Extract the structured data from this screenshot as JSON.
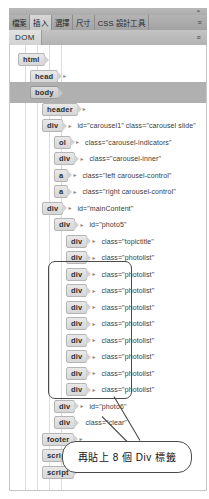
{
  "window": {
    "toolbar_tabs": [
      {
        "label": "檔案",
        "active": false
      },
      {
        "label": "插入",
        "active": true
      },
      {
        "label": "選擇",
        "active": false
      },
      {
        "label": "尺寸",
        "active": false
      },
      {
        "label": "CSS 設計工具",
        "active": false
      }
    ],
    "toolbar_menu_icon": "panel-menu-icon",
    "resize_corner_icon": "resize-grip-icon"
  },
  "panel": {
    "tab_label": "DOM",
    "menu_icon": "panel-options-icon"
  },
  "tree": {
    "nodes": [
      {
        "tag": "html",
        "attrs": "",
        "indent": 0,
        "selected": false,
        "arrow": false
      },
      {
        "tag": "head",
        "attrs": "",
        "indent": 1,
        "selected": false,
        "arrow": true
      },
      {
        "tag": "body",
        "attrs": "",
        "indent": 1,
        "selected": true,
        "arrow": false
      },
      {
        "tag": "header",
        "attrs": "",
        "indent": 2,
        "selected": false,
        "arrow": true
      },
      {
        "tag": "div",
        "attrs": "id=\"carousel1\" class=\"carousel slide\"",
        "indent": 2,
        "selected": false,
        "arrow": true
      },
      {
        "tag": "ol",
        "attrs": "class=\"carousel-indicators\"",
        "indent": 3,
        "selected": false,
        "arrow": true
      },
      {
        "tag": "div",
        "attrs": "class=\"carousel-inner\"",
        "indent": 3,
        "selected": false,
        "arrow": true
      },
      {
        "tag": "a",
        "attrs": "class=\"left carousel-control\"",
        "indent": 3,
        "selected": false,
        "arrow": true
      },
      {
        "tag": "a",
        "attrs": "class=\"right carousel-control\"",
        "indent": 3,
        "selected": false,
        "arrow": true
      },
      {
        "tag": "div",
        "attrs": "id=\"mainContent\"",
        "indent": 2,
        "selected": false,
        "arrow": true
      },
      {
        "tag": "div",
        "attrs": "id=\"photo5\"",
        "indent": 3,
        "selected": false,
        "arrow": true
      },
      {
        "tag": "div",
        "attrs": "class=\"topictitle\"",
        "indent": 4,
        "selected": false,
        "arrow": true
      },
      {
        "tag": "div",
        "attrs": "class=\"photolist\"",
        "indent": 4,
        "selected": false,
        "arrow": true
      },
      {
        "tag": "div",
        "attrs": "class=\"photolist\"",
        "indent": 4,
        "selected": false,
        "arrow": true
      },
      {
        "tag": "div",
        "attrs": "class=\"photolist\"",
        "indent": 4,
        "selected": false,
        "arrow": true
      },
      {
        "tag": "div",
        "attrs": "class=\"photolist\"",
        "indent": 4,
        "selected": false,
        "arrow": true
      },
      {
        "tag": "div",
        "attrs": "class=\"photolist\"",
        "indent": 4,
        "selected": false,
        "arrow": true
      },
      {
        "tag": "div",
        "attrs": "class=\"photolist\"",
        "indent": 4,
        "selected": false,
        "arrow": true
      },
      {
        "tag": "div",
        "attrs": "class=\"photolist\"",
        "indent": 4,
        "selected": false,
        "arrow": true
      },
      {
        "tag": "div",
        "attrs": "class=\"photolist\"",
        "indent": 4,
        "selected": false,
        "arrow": true
      },
      {
        "tag": "div",
        "attrs": "class=\"photolist\"",
        "indent": 4,
        "selected": false,
        "arrow": true
      },
      {
        "tag": "div",
        "attrs": "id=\"photo6\"",
        "indent": 3,
        "selected": false,
        "arrow": true
      },
      {
        "tag": "div",
        "attrs": "class=\"clear\"",
        "indent": 3,
        "selected": false,
        "arrow": false
      },
      {
        "tag": "footer",
        "attrs": "",
        "indent": 2,
        "selected": false,
        "arrow": true
      },
      {
        "tag": "script",
        "attrs": "",
        "indent": 2,
        "selected": false,
        "arrow": false
      },
      {
        "tag": "script",
        "attrs": "",
        "indent": 2,
        "selected": false,
        "arrow": false
      }
    ]
  },
  "annotation": {
    "callout_text": "再貼上 8 個 Div 標籤",
    "highlight_first_node_index": 13,
    "highlight_count": 8
  }
}
